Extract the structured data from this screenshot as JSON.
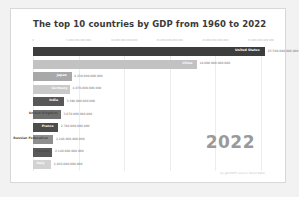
{
  "card": {
    "background": "#ffffff",
    "page_background": "#f2f2f2"
  },
  "credit": "by @CTWTT  source: World Bank",
  "year_label": "2022",
  "chart_data": {
    "type": "bar",
    "orientation": "horizontal",
    "title": "The top 10 countries by GDP from 1960 to 2022",
    "xlabel": "",
    "ylabel": "",
    "grid": true,
    "legend": "none",
    "xlim": [
      0,
      27000000000000
    ],
    "tick_labels": [
      "0",
      "5,000,000,000,000",
      "10,000,000,000,000",
      "15,000,000,000,000",
      "20,000,000,000,000",
      "25,000,000,000,000"
    ],
    "tick_values": [
      0,
      5000000000000,
      10000000000000,
      15000000000000,
      20000000000000,
      25000000000000
    ],
    "categories": [
      "United States",
      "China",
      "Japan",
      "Germany",
      "India",
      "United Kingdom",
      "France",
      "Russian Federation",
      "Canada",
      "Italy"
    ],
    "values": [
      25500000000000,
      18000000000000,
      4230000000000,
      4070000000000,
      3390000000000,
      3070000000000,
      2780000000000,
      2240000000000,
      2140000000000,
      2010000000000
    ],
    "value_labels": [
      "25,500,000,000,000",
      "18,000,000,000,000",
      "4,230,000,000,000",
      "4,070,000,000,000",
      "3,390,000,000,000",
      "3,070,000,000,000",
      "2,780,000,000,000",
      "2,240,000,000,000",
      "2,140,000,000,000",
      "2,010,000,000,000"
    ],
    "bar_colors": [
      "#3d3d3d",
      "#c2c2c2",
      "#a8a8a8",
      "#c9c9c9",
      "#585858",
      "#6e6e6e",
      "#4c4c4c",
      "#8e8e8e",
      "#5a5a5a",
      "#d2d2d2"
    ]
  }
}
